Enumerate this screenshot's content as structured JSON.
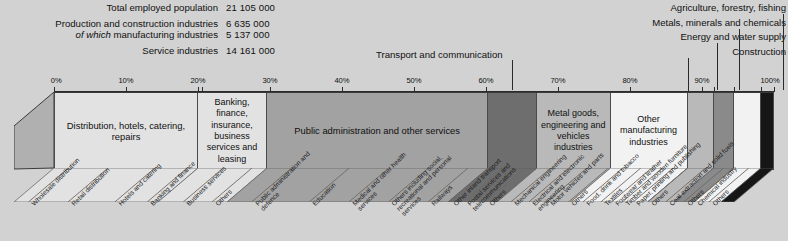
{
  "summary": {
    "rows": [
      {
        "label": "Total employed population",
        "value": "21 105 000",
        "italic_prefix": ""
      },
      {
        "label": "Production and construction industries",
        "value": "6 635 000",
        "italic_prefix": ""
      },
      {
        "label": "of which manufacturing industries",
        "value": "5 137 000",
        "italic_prefix": "of which"
      },
      {
        "label": "Service industries",
        "value": "14 161 000",
        "italic_prefix": ""
      }
    ]
  },
  "callouts": [
    {
      "text": "Agriculture, forestry, fishing"
    },
    {
      "text": "Metals, minerals and chemicals"
    },
    {
      "text": "Energy and water supply"
    },
    {
      "text": "Construction"
    }
  ],
  "transport_callout": {
    "text": "Transport and communication"
  },
  "axis": {
    "ticks": [
      "0%",
      "10%",
      "20%",
      "30%",
      "40%",
      "50%",
      "60%",
      "70%",
      "80%",
      "90%",
      "100%"
    ],
    "min": 0,
    "max": 100
  },
  "colors": {
    "background": "#d2d2d2",
    "seg_light": "#e2e2e2",
    "seg_white": "#f2f2f2",
    "seg_mid": "#b9b9b9",
    "seg_grey": "#a2a2a2",
    "seg_dark": "#8a8a8a",
    "seg_darker": "#6e6e6e",
    "seg_black": "#161616",
    "rule": "#2b2b2b"
  },
  "chart_data": {
    "type": "bar",
    "orientation": "stacked-horizontal-100pct",
    "xlabel": "",
    "ylabel": "",
    "xlim": [
      0,
      100
    ],
    "grid": false,
    "legend": "callouts",
    "units": "percent of total employed population",
    "major_segments": [
      {
        "label": "Distribution, hotels, catering, repairs",
        "start": 0,
        "end": 20.0,
        "fill": "#e2e2e2"
      },
      {
        "label": "Banking, finance, insurance, business services and leasing",
        "start": 20.0,
        "end": 29.6,
        "fill": "#e2e2e2"
      },
      {
        "label": "Public administration and other services",
        "start": 29.6,
        "end": 60.3,
        "fill": "#a2a2a2"
      },
      {
        "label": "Transport and communication",
        "start": 60.3,
        "end": 67.1,
        "fill": "#6e6e6e"
      },
      {
        "label": "Metal goods, engineering and vehicles industries",
        "start": 67.1,
        "end": 77.3,
        "fill": "#b9b9b9"
      },
      {
        "label": "Other manufacturing industries",
        "start": 77.3,
        "end": 88.0,
        "fill": "#f2f2f2"
      },
      {
        "label": "Metals, minerals and chemicals",
        "start": 88.0,
        "end": 91.6,
        "fill": "#b9b9b9"
      },
      {
        "label": "Energy and water supply",
        "start": 91.6,
        "end": 94.4,
        "fill": "#8a8a8a"
      },
      {
        "label": "Construction",
        "start": 94.4,
        "end": 98.2,
        "fill": "#f2f2f2"
      },
      {
        "label": "Agriculture, forestry, fishing",
        "start": 98.2,
        "end": 100.0,
        "fill": "#161616"
      }
    ],
    "sub_segments": [
      {
        "label": "Wholesale distribution",
        "pos": 2.0
      },
      {
        "label": "Retail distribution",
        "pos": 7.5
      },
      {
        "label": "Hotels and catering",
        "pos": 14.0
      },
      {
        "label": "Banking and finance",
        "pos": 18.5
      },
      {
        "label": "Business services",
        "pos": 23.5
      },
      {
        "label": "Others",
        "pos": 27.5
      },
      {
        "label": "Public administration and defence",
        "pos": 33.0
      },
      {
        "label": "Education",
        "pos": 41.0
      },
      {
        "label": "Medical and other health services",
        "pos": 46.5
      },
      {
        "label": "Others including social, recreational and personal services",
        "pos": 52.0
      },
      {
        "label": "Railways",
        "pos": 57.5
      },
      {
        "label": "Other inland transport",
        "pos": 60.5
      },
      {
        "label": "Postal services and telecommunications",
        "pos": 62.5
      },
      {
        "label": "Others",
        "pos": 65.5
      },
      {
        "label": "Mechanical engineering",
        "pos": 69.0
      },
      {
        "label": "Electrical and electronic engineering",
        "pos": 71.5
      },
      {
        "label": "Motor vehicles and parts",
        "pos": 74.0
      },
      {
        "label": "Others",
        "pos": 77.0
      },
      {
        "label": "Food, drink and tobacco",
        "pos": 79.0
      },
      {
        "label": "Textiles",
        "pos": 81.5
      },
      {
        "label": "Footwear and leather",
        "pos": 83.0
      },
      {
        "label": "Timber and wooden furniture",
        "pos": 84.5
      },
      {
        "label": "Paper, printing and publishing",
        "pos": 86.0
      },
      {
        "label": "Others",
        "pos": 88.0
      },
      {
        "label": "Coal extraction and solid fuels",
        "pos": 90.5
      },
      {
        "label": "Others",
        "pos": 93.0
      },
      {
        "label": "Chemical industry",
        "pos": 94.5
      },
      {
        "label": "Others",
        "pos": 96.5
      }
    ]
  }
}
